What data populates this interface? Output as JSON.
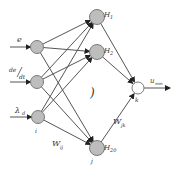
{
  "diagram": {
    "type": "neural-network",
    "colors": {
      "node_fill": "#bdbdbd",
      "node_stroke": "#7a7a7a",
      "output_fill": "#ffffff",
      "edge": "#555555"
    },
    "inputs": [
      {
        "id": "e",
        "label": "e"
      },
      {
        "id": "dedt",
        "label_num": "de",
        "label_den": "dt"
      },
      {
        "id": "lambda",
        "label": "λ",
        "subscript": "d"
      }
    ],
    "input_layer_label": "i",
    "hidden": [
      {
        "id": "h1",
        "label": "H",
        "subscript": "1"
      },
      {
        "id": "h2",
        "label": "H",
        "subscript": "2"
      },
      {
        "id": "h20",
        "label": "H",
        "subscript": "20"
      }
    ],
    "hidden_layer_label": "j",
    "ellipsis": ")",
    "output": {
      "id": "k",
      "label": "k",
      "signal": "u",
      "signal_subscript": "mm"
    },
    "weights": {
      "input_hidden": {
        "label": "W",
        "subscript": "ij"
      },
      "hidden_output": {
        "label": "W",
        "subscript": "jk"
      }
    }
  }
}
